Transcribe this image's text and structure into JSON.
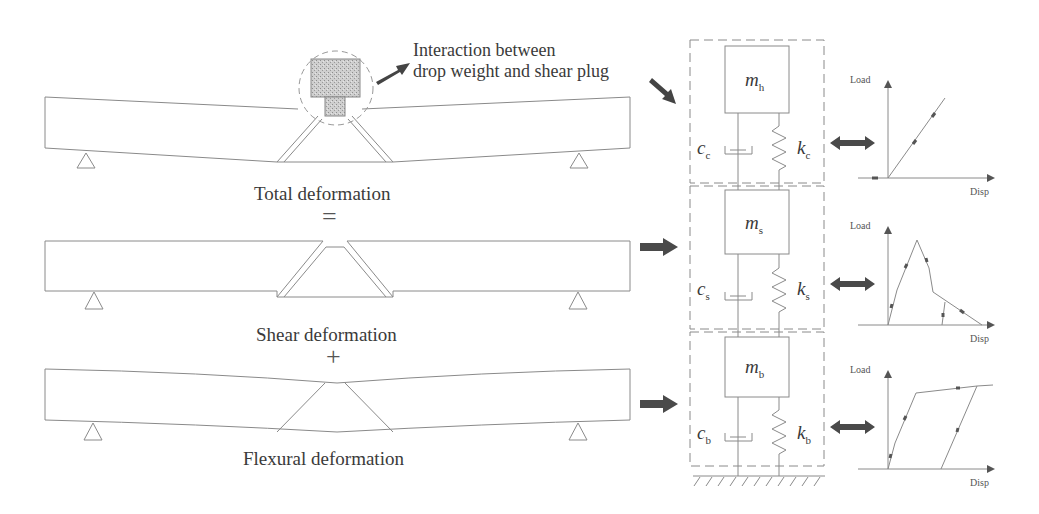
{
  "annotation": {
    "line1": "Interaction between",
    "line2": "drop weight and shear plug"
  },
  "beams": [
    {
      "caption": "Total deformation"
    },
    {
      "caption": "Shear deformation"
    },
    {
      "caption": "Flexural deformation"
    }
  ],
  "operators": {
    "equals": "=",
    "plus": "+"
  },
  "spring_mass": [
    {
      "mass": "m",
      "mass_sub": "h",
      "damper": "c",
      "damper_sub": "c",
      "spring": "k",
      "spring_sub": "c"
    },
    {
      "mass": "m",
      "mass_sub": "s",
      "damper": "c",
      "damper_sub": "s",
      "spring": "k",
      "spring_sub": "s"
    },
    {
      "mass": "m",
      "mass_sub": "b",
      "damper": "c",
      "damper_sub": "b",
      "spring": "k",
      "spring_sub": "b"
    }
  ],
  "graphs": [
    {
      "ylabel": "Load",
      "xlabel": "Disp",
      "behavior": "linear elastic loading/unloading"
    },
    {
      "ylabel": "Load",
      "xlabel": "Disp",
      "behavior": "peak then softening"
    },
    {
      "ylabel": "Load",
      "xlabel": "Disp",
      "behavior": "elastic-plastic with unloading"
    }
  ],
  "colors": {
    "line": "#8a8a8a",
    "arrow": "#4a4a4a",
    "weight": "#b8b8b8",
    "text": "#3a3a3a"
  }
}
